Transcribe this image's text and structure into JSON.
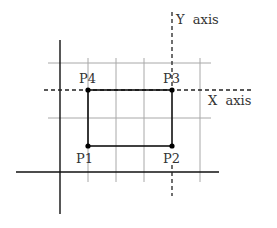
{
  "diagram": {
    "labels": {
      "p1": "P1",
      "p2": "P2",
      "p3": "P3",
      "p4": "P4",
      "x_axis": "X  axis",
      "y_axis": "Y  axis"
    },
    "points": {
      "p1": [
        88,
        146
      ],
      "p2": [
        172,
        146
      ],
      "p3": [
        172,
        90
      ],
      "p4": [
        88,
        90
      ]
    },
    "colors": {
      "line": "#111111",
      "grid": "#9a9a9a",
      "text": "#333333"
    }
  }
}
